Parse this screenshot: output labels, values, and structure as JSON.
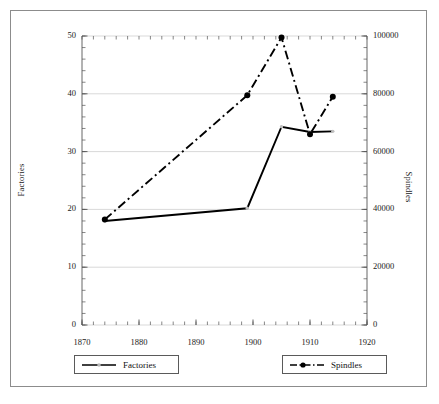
{
  "chart_data": {
    "type": "line",
    "title": "",
    "xlabel": "",
    "ylabel": "Factories",
    "y2label": "Spindles",
    "xlim": [
      1870,
      1920
    ],
    "ylim": [
      0,
      50
    ],
    "y2lim": [
      0,
      100000
    ],
    "grid": true,
    "grid_axis": "y",
    "legend_position": "below-plot",
    "x_ticks": [
      1870,
      1880,
      1890,
      1900,
      1910,
      1920
    ],
    "x_tick_labels": [
      "1870",
      "1880",
      "1890",
      "1900",
      "1910",
      "1920"
    ],
    "x_minor_tick_step": 2,
    "y_ticks": [
      0,
      10,
      20,
      30,
      40,
      50
    ],
    "y_tick_labels": [
      "0",
      "10",
      "20",
      "30",
      "40",
      "50"
    ],
    "y_minor_tick_step": 2,
    "y2_ticks": [
      0,
      20000,
      40000,
      60000,
      80000,
      100000
    ],
    "y2_tick_labels": [
      "0",
      "20000",
      "40000",
      "60000",
      "80000",
      "100000"
    ],
    "y2_minor_tick_step": 4000,
    "x": [
      1874,
      1899,
      1905,
      1910,
      1914
    ],
    "series": [
      {
        "name": "Factories",
        "axis": "left",
        "style": "solid",
        "color": "#000000",
        "marker": "none",
        "values": [
          18.0,
          20.2,
          34.3,
          33.4,
          33.5
        ]
      },
      {
        "name": "Spindles",
        "axis": "right",
        "style": "dash-dot",
        "color": "#000000",
        "marker": "circle",
        "values": [
          36500,
          79500,
          99500,
          66000,
          79000
        ]
      }
    ]
  },
  "legend": {
    "items": [
      {
        "label": "Factories",
        "style": "solid",
        "marker": "none"
      },
      {
        "label": "Spindles",
        "style": "dash-dot",
        "marker": "circle"
      }
    ]
  },
  "colors": {
    "line": "#000000",
    "grid": "#c8c8c8",
    "axis": "#555555",
    "frame": "#8c8c8c",
    "background": "#ffffff"
  }
}
